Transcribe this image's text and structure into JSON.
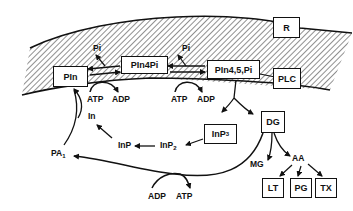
{
  "diagram": {
    "type": "phosphoinositide-cycle",
    "nodes": {
      "pin": "PIn",
      "pin4pi": "PIn4Pi",
      "pin45pi": "PIn4,5,Pi",
      "receptor": "R",
      "plc": "PLC",
      "dg": "DG",
      "inp3_base": "InP",
      "inp3_sub": "3",
      "lt": "LT",
      "pg": "PG",
      "tx": "TX"
    },
    "labels": {
      "pi_1": "Pi",
      "pi_2": "Pi",
      "atp_1": "ATP",
      "adp_1": "ADP",
      "atp_2": "ATP",
      "adp_2": "ADP",
      "in": "In",
      "inp": "InP",
      "inp2_base": "InP",
      "inp2_sub": "2",
      "pa_base": "PA",
      "pa_sub": "1",
      "mg": "MG",
      "aa": "AA",
      "adp_3": "ADP",
      "atp_3": "ATP"
    },
    "edges": [
      {
        "from": "PIn",
        "to": "PIn4Pi",
        "cofactor": "ATP→ADP"
      },
      {
        "from": "PIn4Pi",
        "to": "PIn",
        "releases": "Pi"
      },
      {
        "from": "PIn4Pi",
        "to": "PIn4,5,Pi",
        "cofactor": "ATP→ADP"
      },
      {
        "from": "PIn4,5,Pi",
        "to": "PIn4Pi",
        "releases": "Pi"
      },
      {
        "from": "PIn4,5,Pi",
        "to": "InP3"
      },
      {
        "from": "PIn4,5,Pi",
        "to": "DG"
      },
      {
        "from": "InP3",
        "to": "InP2"
      },
      {
        "from": "InP2",
        "to": "InP"
      },
      {
        "from": "InP",
        "to": "In"
      },
      {
        "from": "In",
        "to": "PIn"
      },
      {
        "from": "PA1",
        "to": "PIn"
      },
      {
        "from": "DG",
        "to": "PA1",
        "cofactor": "ADP/ATP"
      },
      {
        "from": "DG",
        "to": "MG"
      },
      {
        "from": "DG",
        "to": "AA"
      },
      {
        "from": "AA",
        "to": "LT"
      },
      {
        "from": "AA",
        "to": "PG"
      },
      {
        "from": "AA",
        "to": "TX"
      }
    ]
  }
}
